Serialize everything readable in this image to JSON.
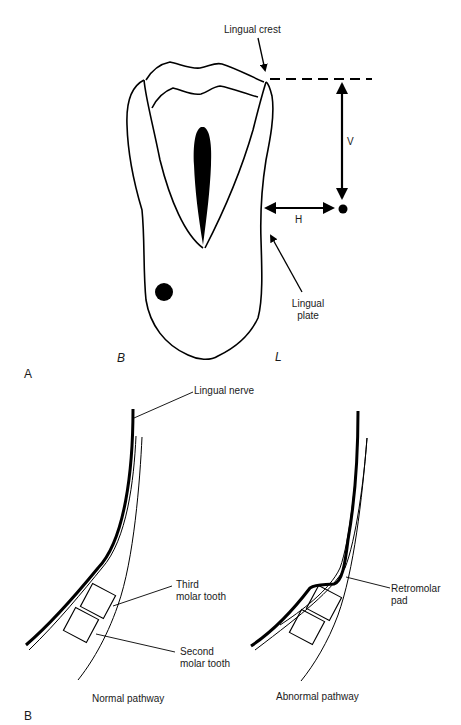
{
  "panel_a": {
    "letter": "A",
    "labels": {
      "lingual_crest": "Lingual crest",
      "vertical": "V",
      "horizontal": "H",
      "lingual_plate_line1": "Lingual",
      "lingual_plate_line2": "plate",
      "buccal": "B",
      "lingual": "L"
    }
  },
  "panel_b": {
    "letter": "B",
    "labels": {
      "lingual_nerve": "Lingual nerve",
      "third_molar_line1": "Third",
      "third_molar_line2": "molar tooth",
      "second_molar_line1": "Second",
      "second_molar_line2": "molar tooth",
      "retromolar_line1": "Retromolar",
      "retromolar_line2": "pad",
      "normal_caption": "Normal pathway",
      "abnormal_caption": "Abnormal pathway"
    }
  }
}
